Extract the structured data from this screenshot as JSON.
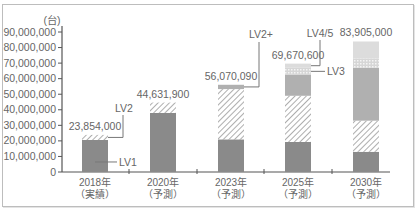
{
  "chart_data": {
    "type": "bar",
    "stacked": true,
    "title": "",
    "ylabel": "(台)",
    "xlabel": "",
    "ylim": [
      0,
      90000000
    ],
    "yticks": [
      0,
      10000000,
      20000000,
      30000000,
      40000000,
      50000000,
      60000000,
      70000000,
      80000000,
      90000000
    ],
    "ytick_labels": [
      "0",
      "10,000,000",
      "20,000,000",
      "30,000,000",
      "40,000,000",
      "50,000,000",
      "60,000,000",
      "70,000,000",
      "80,000,000",
      "90,000,000"
    ],
    "grid": false,
    "categories": [
      "2018年（実績）",
      "2020年（予測）",
      "2023年（予測）",
      "2025年（予測）",
      "2030年（予測）"
    ],
    "category_lines": [
      [
        "2018年",
        "（実績）"
      ],
      [
        "2020年",
        "（予測）"
      ],
      [
        "2023年",
        "（予測）"
      ],
      [
        "2025年",
        "（予測）"
      ],
      [
        "2030年",
        "（予測）"
      ]
    ],
    "totals": [
      23854000,
      44631900,
      56070090,
      69670600,
      83905000
    ],
    "total_labels": [
      "23,854,000",
      "44,631,900",
      "56,070,090",
      "69,670,600",
      "83,905,000"
    ],
    "series": [
      {
        "name": "LV1",
        "color": "#8a8a8a",
        "pattern": "solid",
        "values": [
          20600000,
          38000000,
          21000000,
          19300000,
          13000000
        ]
      },
      {
        "name": "LV2",
        "color": "#b5b5b5",
        "pattern": "hatch",
        "values": [
          3254000,
          6631900,
          32300000,
          29700000,
          20000000
        ]
      },
      {
        "name": "LV2+",
        "color": "#b0b0b0",
        "pattern": "solid",
        "values": [
          0,
          0,
          2770090,
          13400000,
          34000000
        ]
      },
      {
        "name": "LV3",
        "color": "#e6e6e6",
        "pattern": "dotted",
        "values": [
          0,
          0,
          0,
          4600000,
          6000000
        ]
      },
      {
        "name": "LV4/5",
        "color": "#dcdcdc",
        "pattern": "solid",
        "values": [
          0,
          0,
          0,
          2670600,
          10905000
        ]
      }
    ],
    "annotations": [
      {
        "text": "LV1",
        "target": "2018 LV1 segment"
      },
      {
        "text": "LV2",
        "target": "2018 LV2 segment"
      },
      {
        "text": "LV2+",
        "target": "2023 LV2+ segment"
      },
      {
        "text": "LV3",
        "target": "2025 LV3 segment"
      },
      {
        "text": "LV4/5",
        "target": "2025 LV4/5 segment"
      }
    ],
    "legend": "none (inline annotations)"
  }
}
